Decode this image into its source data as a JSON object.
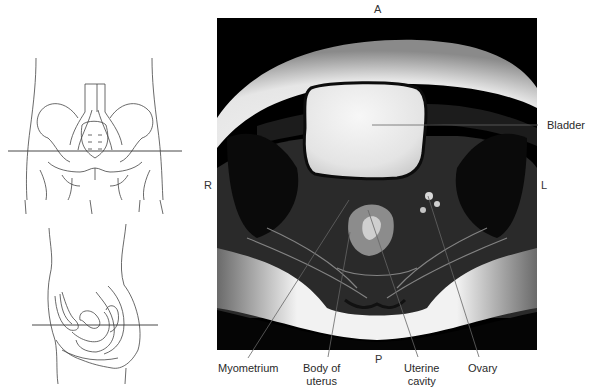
{
  "figure": {
    "orientation": {
      "anterior": "A",
      "posterior": "P",
      "right": "R",
      "left": "L"
    },
    "labels": {
      "bladder": "Bladder",
      "myometrium": "Myometrium",
      "body_of_uterus_line1": "Body of",
      "body_of_uterus_line2": "uterus",
      "uterine_cavity_line1": "Uterine",
      "uterine_cavity_line2": "cavity",
      "ovary": "Ovary"
    },
    "colors": {
      "mri_background": "#000000",
      "line": "#555555",
      "text": "#2a2a2a"
    }
  }
}
